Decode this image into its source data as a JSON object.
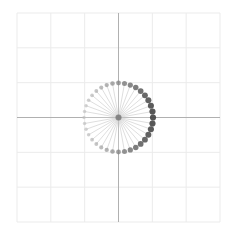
{
  "chart_data": {
    "type": "scatter",
    "title": "",
    "xlabel": "",
    "ylabel": "",
    "xlim": [
      -3,
      3
    ],
    "ylim": [
      -3,
      3
    ],
    "grid": true,
    "grid_step": 1,
    "axes_through_origin": true,
    "radius": 1,
    "n_points": 36,
    "angle_step_deg": 10,
    "angles_deg": [
      0,
      10,
      20,
      30,
      40,
      50,
      60,
      70,
      80,
      90,
      100,
      110,
      120,
      130,
      140,
      150,
      160,
      170,
      180,
      190,
      200,
      210,
      220,
      230,
      240,
      250,
      260,
      270,
      280,
      290,
      300,
      310,
      320,
      330,
      340,
      350
    ],
    "spokes": true,
    "legend": null
  },
  "colors": {
    "background": "#ffffff",
    "grid": "#ebebeb",
    "axis": "#b0b0b0",
    "spoke": "#c8c8c8",
    "marker_dark": "#444444",
    "marker_light": "#bbbbbb"
  },
  "layout": {
    "plot_left": 17,
    "plot_top": 13,
    "plot_right": 220,
    "plot_bottom": 222,
    "center_x": 118.5,
    "center_y": 117.5,
    "radius_px": 34.5
  }
}
